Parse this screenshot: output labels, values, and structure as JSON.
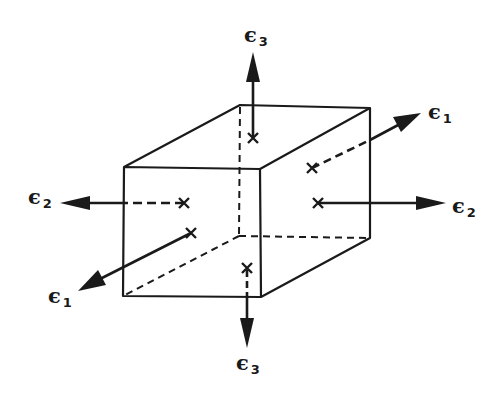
{
  "diagram": {
    "colors": {
      "stroke": "#1a1a1a",
      "background": "#ffffff"
    },
    "labels": {
      "e3_top": {
        "symbol": "ϵ",
        "sub": "3"
      },
      "e1_right": {
        "symbol": "ϵ",
        "sub": "1"
      },
      "e2_right": {
        "symbol": "ϵ",
        "sub": "2"
      },
      "e2_left": {
        "symbol": "ϵ",
        "sub": "2"
      },
      "e1_left": {
        "symbol": "ϵ",
        "sub": "1"
      },
      "e3_bottom": {
        "symbol": "ϵ",
        "sub": "3"
      }
    },
    "face_markers": "x marks face centers where strain arrows originate"
  }
}
